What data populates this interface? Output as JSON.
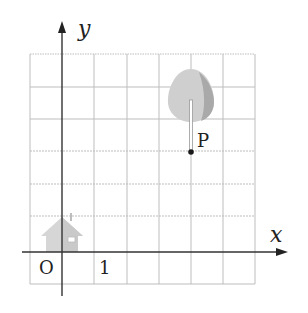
{
  "diagram": {
    "type": "coordinate-grid",
    "axes": {
      "x_label": "x",
      "y_label": "y",
      "origin_label": "O",
      "unit_label": "1"
    },
    "grid": {
      "columns": 7,
      "rows": 7,
      "x_range": [
        -1,
        6
      ],
      "y_range": [
        -1,
        6
      ]
    },
    "point": {
      "label": "P",
      "x": 4,
      "y": 3
    },
    "icons": [
      {
        "name": "house-icon",
        "position": "at origin, upper-left quadrant edge"
      },
      {
        "name": "tree-icon",
        "position": "above point P"
      }
    ],
    "colors": {
      "grid": "#b8b8b8",
      "axis": "#333333",
      "icon_fill": "#d4d4d4",
      "icon_shade": "#a8a8a8",
      "point": "#222222"
    }
  }
}
